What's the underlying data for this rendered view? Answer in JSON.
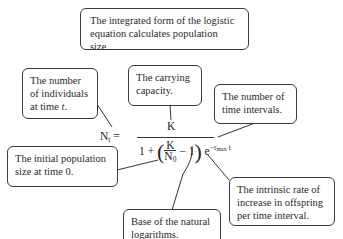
{
  "title_box": {
    "text": "The integrated form of the logistic equation calculates population size."
  },
  "callouts": {
    "nt": {
      "line1": "The number",
      "line2": "of individuals",
      "line3": "at time ",
      "var": "t",
      "end": "."
    },
    "k": {
      "text": "The carrying capacity."
    },
    "t": {
      "text": "The number of time intervals."
    },
    "n0": {
      "text": "The initial population size at time 0."
    },
    "e": {
      "text": "Base of the natural logarithms."
    },
    "rmax": {
      "text": "The intrinsic rate of increase in offspring per time interval."
    }
  },
  "equation": {
    "lhs": "N",
    "lhs_sub": "t",
    "equals": "=",
    "numerator": "K",
    "denom_one": "1 +",
    "inner_num": "K",
    "inner_den": "N",
    "inner_den_sub": "0",
    "minus_one": "− 1",
    "base": "e",
    "exp_sign": "−r",
    "exp_sub": "max",
    "exp_var": "t"
  },
  "colors": {
    "border": "#3a3a3a",
    "text": "#2a2a2a",
    "background": "#ffffff"
  }
}
